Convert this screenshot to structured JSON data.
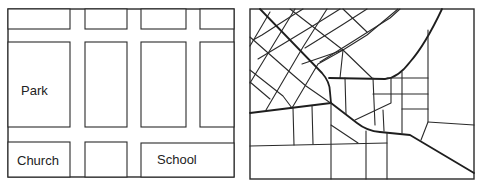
{
  "figure": {
    "panels": [
      {
        "id": "grid-map",
        "description": "Regular rectangular street grid",
        "labels": [
          {
            "text": "Park",
            "x": 21,
            "y": 95
          },
          {
            "text": "Church",
            "x": 17,
            "y": 164
          },
          {
            "text": "School",
            "x": 157,
            "y": 164
          }
        ]
      },
      {
        "id": "irregular-map",
        "description": "Irregular street network with diagonal grid and curved roads"
      }
    ]
  },
  "labels": {
    "park": "Park",
    "church": "Church",
    "school": "School"
  }
}
